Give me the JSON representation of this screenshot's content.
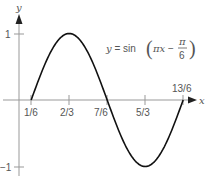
{
  "chart_data": {
    "type": "line",
    "title": "",
    "equation_label": {
      "lhs": "y = sin",
      "inner": "πx − ",
      "frac_num": "π",
      "frac_den": "6"
    },
    "xlabel": "x",
    "ylabel": "y",
    "x_ticks": [
      "1/6",
      "2/3",
      "7/6",
      "5/3",
      "13/6"
    ],
    "x_tick_values": [
      0.1667,
      0.6667,
      1.1667,
      1.6667,
      2.1667
    ],
    "y_ticks": [
      "1",
      "−1"
    ],
    "y_tick_values": [
      1,
      -1
    ],
    "xlim": [
      0,
      2.4
    ],
    "ylim": [
      -1.1,
      1.3
    ],
    "grid": false,
    "series": [
      {
        "name": "y = sin(πx − π/6)",
        "x": [
          0.1667,
          0.4167,
          0.6667,
          0.9167,
          1.1667,
          1.4167,
          1.6667,
          1.9167,
          2.1667
        ],
        "y": [
          0,
          0.707,
          1,
          0.707,
          0,
          -0.707,
          -1,
          -0.707,
          0
        ]
      }
    ]
  }
}
